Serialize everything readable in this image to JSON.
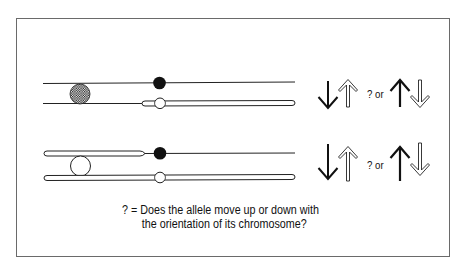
{
  "figure": {
    "rows": [
      {
        "id": "top-pair",
        "allele_style": "cross-hatched",
        "upper_chromosome": "thin line with black centromere",
        "lower_chromosome": "thin line left of centromere, hollow tube right, open centromere",
        "arrows_left": [
          "down-solid",
          "up-hollow"
        ],
        "connector": "? or",
        "arrows_right": [
          "up-solid",
          "down-hollow"
        ]
      },
      {
        "id": "bottom-pair",
        "allele_style": "open",
        "upper_chromosome": "hollow tube left, black centromere, thin line right",
        "lower_chromosome": "hollow tube full length with open centromere",
        "arrows_left": [
          "down-solid",
          "up-hollow"
        ],
        "connector": "? or",
        "arrows_right": [
          "up-solid",
          "down-hollow"
        ]
      }
    ],
    "labels": {
      "row1_connector": "? or",
      "row2_connector": "? or"
    },
    "caption": {
      "line1": "? = Does the allele move up or down with",
      "line2": "the orientation of its chromosome?"
    },
    "colors": {
      "ink": "#111111",
      "frame": "#6a6a6a",
      "background": "#ffffff"
    }
  }
}
